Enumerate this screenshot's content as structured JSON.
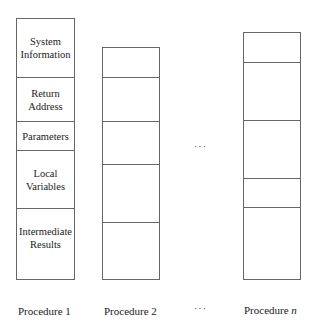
{
  "diagram": {
    "type": "stack-frames",
    "columns": [
      {
        "id": "procedure-1",
        "label": "Procedure 1",
        "segments": [
          {
            "text": "System Information"
          },
          {
            "text": "Return Address"
          },
          {
            "text": "Parameters"
          },
          {
            "text": "Local Variables"
          },
          {
            "text": "Intermediate Results"
          }
        ]
      },
      {
        "id": "procedure-2",
        "label": "Procedure 2",
        "segments": [
          {
            "text": ""
          },
          {
            "text": ""
          },
          {
            "text": ""
          },
          {
            "text": ""
          },
          {
            "text": ""
          }
        ]
      },
      {
        "id": "procedure-n",
        "label": "Procedure n",
        "label_prefix": "Procedure ",
        "label_var": "n",
        "segments": [
          {
            "text": ""
          },
          {
            "text": ""
          },
          {
            "text": ""
          },
          {
            "text": ""
          },
          {
            "text": ""
          }
        ]
      }
    ],
    "ellipsis_middle": "···",
    "ellipsis_bottom": "···"
  }
}
